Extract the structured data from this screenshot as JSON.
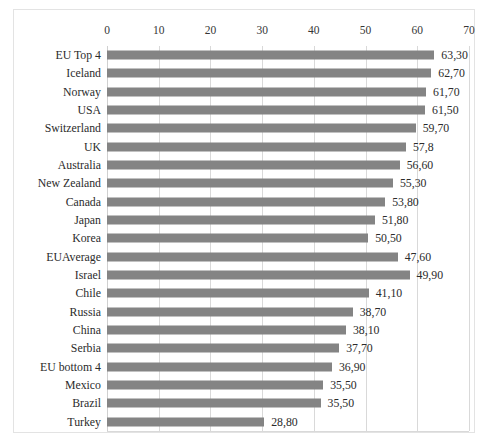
{
  "chart_data": {
    "type": "bar",
    "orientation": "horizontal",
    "title": "",
    "subtitle": "",
    "xlabel": "",
    "ylabel": "",
    "xlim": [
      0,
      70
    ],
    "xticks": [
      "0",
      "10",
      "20",
      "30",
      "40",
      "50",
      "60",
      "70"
    ],
    "xtick_values": [
      0,
      10,
      20,
      30,
      40,
      50,
      60,
      70
    ],
    "grid": "vertical",
    "legend": "none",
    "bar_color": "#848484",
    "gridline_color": "#d9d9d9",
    "border_color": "#e3e3e3",
    "decimal_separator": ",",
    "categories": [
      "EU Top 4",
      "Iceland",
      "Norway",
      "USA",
      "Switzerland",
      "UK",
      "Australia",
      "New Zealand",
      "Canada",
      "Japan",
      "Korea",
      "EUAverage",
      "Israel",
      "Chile",
      "Russia",
      "China",
      "Serbia",
      "EU bottom 4",
      "Mexico",
      "Brazil",
      "Turkey"
    ],
    "values": [
      63.3,
      62.7,
      61.7,
      61.5,
      59.7,
      57.8,
      56.6,
      55.3,
      53.8,
      51.8,
      50.5,
      47.6,
      49.9,
      41.1,
      38.7,
      38.1,
      37.7,
      36.9,
      35.5,
      35.5,
      28.8
    ],
    "bar_lengths": [
      63.3,
      62.7,
      61.7,
      61.5,
      59.7,
      57.8,
      56.6,
      55.3,
      53.8,
      51.8,
      50.5,
      56.2,
      58.5,
      50.6,
      47.5,
      46.2,
      44.9,
      43.5,
      41.8,
      41.3,
      30.4
    ],
    "data_labels": [
      "63,30",
      "62,70",
      "61,70",
      "61,50",
      "59,70",
      "57,8",
      "56,60",
      "55,30",
      "53,80",
      "51,80",
      "50,50",
      "47,60",
      "49,90",
      "41,10",
      "38,70",
      "38,10",
      "37,70",
      "36,90",
      "35,50",
      "35,50",
      "28,80"
    ]
  }
}
